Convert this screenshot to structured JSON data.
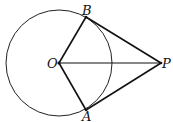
{
  "diagram": {
    "points": {
      "O": {
        "label": "O",
        "x": 59,
        "y": 63
      },
      "B": {
        "label": "B",
        "x": 86,
        "y": 17
      },
      "A": {
        "label": "A",
        "x": 86,
        "y": 110
      },
      "P": {
        "label": "P",
        "x": 161,
        "y": 63
      }
    },
    "circle": {
      "center": "O",
      "radius": 53
    },
    "segments": [
      "OB",
      "OA",
      "OP",
      "BP",
      "AP"
    ]
  }
}
